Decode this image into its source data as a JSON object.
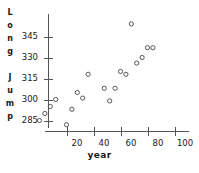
{
  "chart_data": {
    "type": "scatter",
    "title": "",
    "xlabel": "year",
    "ylabel": "Long Jump",
    "xlim": [
      -4,
      104
    ],
    "ylim": [
      280,
      357
    ],
    "grid": false,
    "legend": "none",
    "marker": "open-circle",
    "marker_color": "#555555",
    "xticks": [
      20,
      40,
      60,
      80,
      100
    ],
    "xtick_labels": [
      "20",
      "40",
      "60",
      "80",
      "100"
    ],
    "yticks": [
      285,
      300,
      315,
      330,
      345
    ],
    "ytick_labels": [
      "285",
      "300",
      "315",
      "330",
      "345"
    ],
    "points": [
      {
        "x": 0,
        "y": 285
      },
      {
        "x": 4,
        "y": 290
      },
      {
        "x": 8,
        "y": 295
      },
      {
        "x": 12,
        "y": 300
      },
      {
        "x": 20,
        "y": 282
      },
      {
        "x": 24,
        "y": 293
      },
      {
        "x": 28,
        "y": 305
      },
      {
        "x": 32,
        "y": 301
      },
      {
        "x": 36,
        "y": 318
      },
      {
        "x": 48,
        "y": 308
      },
      {
        "x": 52,
        "y": 299
      },
      {
        "x": 56,
        "y": 308
      },
      {
        "x": 60,
        "y": 320
      },
      {
        "x": 64,
        "y": 318
      },
      {
        "x": 68,
        "y": 354
      },
      {
        "x": 72,
        "y": 326
      },
      {
        "x": 76,
        "y": 330
      },
      {
        "x": 80,
        "y": 337
      },
      {
        "x": 84,
        "y": 337
      }
    ]
  },
  "axes": {
    "ylabel_chars": [
      "L",
      "o",
      "n",
      "g",
      " ",
      "J",
      "u",
      "m",
      "p"
    ]
  }
}
